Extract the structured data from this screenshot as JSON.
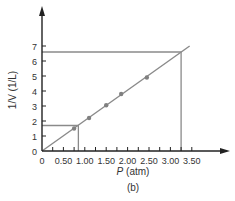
{
  "chart_data": {
    "type": "scatter",
    "title": "",
    "caption": "(b)",
    "xlabel_italic": "P",
    "xlabel_unit": " (atm)",
    "ylabel": "1/V (1/L)",
    "xlim": [
      0,
      3.75
    ],
    "ylim": [
      0,
      8
    ],
    "x_ticks": [
      "0",
      "0.50",
      "1.00",
      "1.50",
      "2.00",
      "2.50",
      "3.00",
      "3.50"
    ],
    "y_ticks": [
      "0",
      "1",
      "2",
      "3",
      "4",
      "5",
      "6",
      "7"
    ],
    "grid": false,
    "series": [
      {
        "name": "data points",
        "x": [
          0.75,
          1.1,
          1.5,
          1.85,
          2.45
        ],
        "y": [
          1.5,
          2.2,
          3.05,
          3.8,
          4.9
        ]
      }
    ],
    "fit_line": {
      "x": [
        0,
        3.45
      ],
      "y": [
        0,
        7.0
      ]
    },
    "guide_lines": [
      {
        "x": 0.85,
        "y": 1.7
      },
      {
        "x": 3.25,
        "y": 6.6
      }
    ],
    "colors": {
      "line": "#8a8a8a",
      "point": "#808080",
      "axis": "#222222",
      "guide": "#8a8a8a"
    }
  }
}
